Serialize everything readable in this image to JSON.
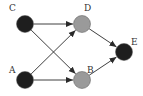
{
  "diagram": {
    "type": "directed-graph",
    "colors": {
      "dark_node": "#1e1e1e",
      "gray_node": "#9a9a9a",
      "edge": "#2a2a2a",
      "label": "#333333"
    },
    "nodes": [
      {
        "id": "C",
        "label": "C",
        "cx": 25,
        "cy": 24,
        "fill": "dark",
        "label_x": 9,
        "label_y": 11
      },
      {
        "id": "D",
        "label": "D",
        "cx": 82,
        "cy": 24,
        "fill": "gray",
        "label_x": 84,
        "label_y": 11
      },
      {
        "id": "E",
        "label": "E",
        "cx": 124,
        "cy": 52,
        "fill": "dark",
        "label_x": 131,
        "label_y": 45
      },
      {
        "id": "A",
        "label": "A",
        "cx": 25,
        "cy": 80,
        "fill": "dark",
        "label_x": 9,
        "label_y": 73
      },
      {
        "id": "B",
        "label": "B",
        "cx": 82,
        "cy": 80,
        "fill": "gray",
        "label_x": 87,
        "label_y": 73
      }
    ],
    "edges": [
      {
        "from": "C",
        "to": "D"
      },
      {
        "from": "C",
        "to": "B"
      },
      {
        "from": "A",
        "to": "D"
      },
      {
        "from": "A",
        "to": "B"
      },
      {
        "from": "D",
        "to": "E"
      },
      {
        "from": "B",
        "to": "E"
      }
    ]
  }
}
